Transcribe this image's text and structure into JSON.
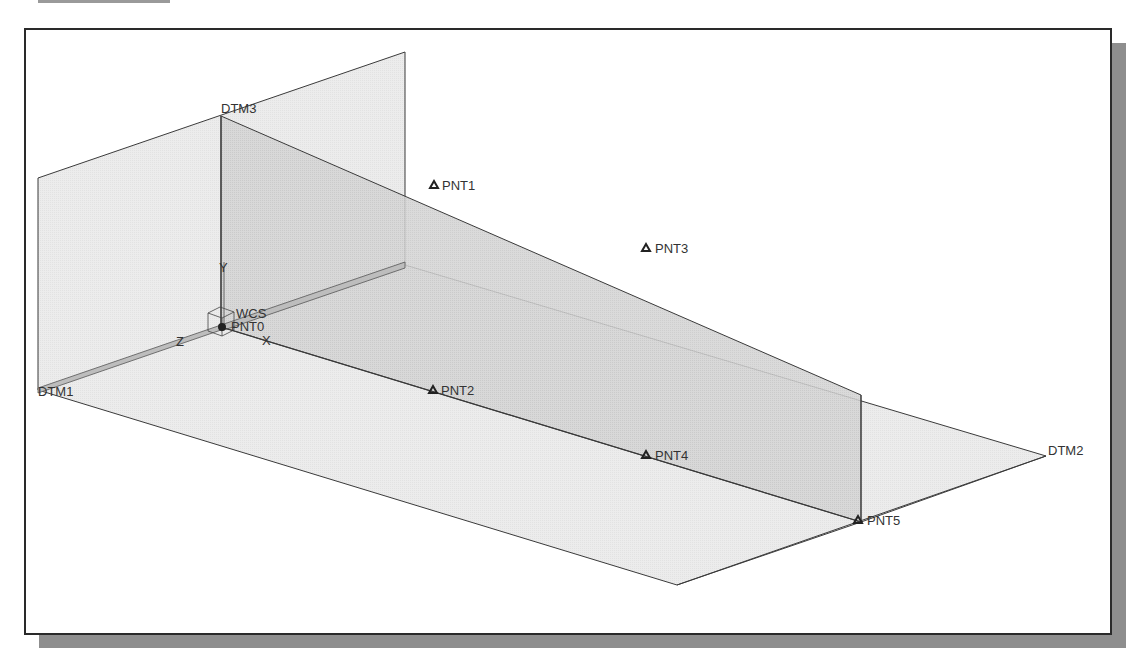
{
  "colors": {
    "frame_border": "#2a2a2a",
    "shadow": "#8e8e8e",
    "plane_light": "#ececec",
    "plane_dark": "#d2d2d2",
    "edge": "#3a3a3a",
    "label": "#333333"
  },
  "planes": [
    {
      "id": "DTM1",
      "label": "DTM1",
      "orientation": "horizontal"
    },
    {
      "id": "DTM2",
      "label": "DTM2",
      "orientation": "vertical-front"
    },
    {
      "id": "DTM3",
      "label": "DTM3",
      "orientation": "vertical-side"
    }
  ],
  "coordinate_system": {
    "label": "WCS",
    "axes": {
      "x": "X",
      "y": "Y",
      "z": "Z"
    }
  },
  "datum_points": [
    {
      "label": "PNT0"
    },
    {
      "label": "PNT1"
    },
    {
      "label": "PNT2"
    },
    {
      "label": "PNT3"
    },
    {
      "label": "PNT4"
    },
    {
      "label": "PNT5"
    }
  ]
}
